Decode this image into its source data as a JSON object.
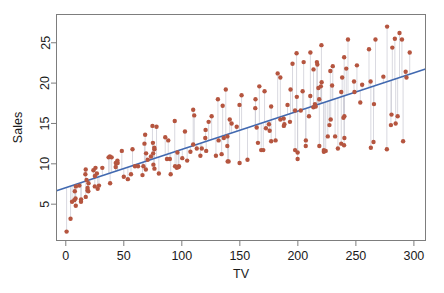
{
  "chart_data": {
    "type": "scatter",
    "title": "",
    "subtitle": "",
    "xlabel": "TV",
    "ylabel": "Sales",
    "xlim": [
      -8,
      310
    ],
    "ylim": [
      0.5,
      28.5
    ],
    "xticks": [
      0,
      50,
      100,
      150,
      200,
      250,
      300
    ],
    "xticklabels": [
      "0",
      "50",
      "100",
      "150",
      "200",
      "250",
      "300"
    ],
    "yticks": [
      5,
      10,
      15,
      20,
      25
    ],
    "yticklabels": [
      "5",
      "10",
      "15",
      "20",
      "25"
    ],
    "grid": false,
    "legend": null,
    "point_color": "#b5553f",
    "point_radius": 2.2,
    "line_color": "#4169b0",
    "line_width": 1.6,
    "residual_color": "#c8c8d2",
    "frame_color": "#7d7d7d",
    "background": "#ffffff",
    "annotations": [],
    "series": [
      {
        "name": "Sales vs TV",
        "x": [
          230.1,
          44.5,
          17.2,
          151.5,
          180.8,
          8.7,
          57.5,
          120.2,
          8.6,
          199.8,
          66.1,
          214.7,
          23.8,
          97.5,
          204.1,
          195.4,
          67.8,
          281.4,
          69.2,
          147.3,
          218.4,
          237.4,
          13.2,
          228.3,
          62.3,
          262.9,
          142.9,
          240.1,
          248.8,
          70.6,
          292.9,
          112.9,
          97.2,
          265.6,
          95.7,
          290.7,
          266.9,
          74.7,
          43.1,
          228.0,
          202.5,
          177.0,
          293.6,
          206.9,
          25.1,
          175.1,
          89.7,
          239.9,
          227.2,
          66.9,
          199.8,
          100.4,
          216.4,
          182.6,
          262.7,
          198.9,
          7.3,
          136.2,
          210.8,
          210.7,
          53.5,
          261.3,
          239.3,
          102.7,
          131.1,
          69.0,
          31.5,
          139.3,
          237.4,
          216.8,
          199.1,
          109.8,
          26.8,
          129.4,
          213.4,
          16.9,
          27.5,
          120.5,
          5.4,
          116.0,
          76.4,
          239.8,
          75.3,
          68.4,
          213.5,
          193.2,
          76.3,
          110.7,
          88.3,
          109.8,
          134.3,
          28.6,
          217.7,
          250.9,
          107.4,
          163.3,
          197.6,
          184.9,
          289.7,
          135.2,
          222.4,
          296.4,
          280.2,
          187.9,
          238.2,
          137.9,
          25.0,
          90.4,
          13.1,
          255.4,
          225.8,
          241.7,
          175.7,
          209.6,
          78.2,
          75.1,
          139.2,
          76.4,
          125.7,
          19.4,
          141.3,
          18.8,
          224.0,
          123.1,
          229.5,
          87.2,
          7.8,
          80.2,
          220.3,
          59.6,
          0.7,
          265.2,
          8.4,
          219.8,
          36.9,
          48.3,
          25.6,
          273.7,
          43.0,
          184.9,
          73.4,
          193.7,
          220.5,
          104.6,
          96.2,
          140.3,
          240.1,
          243.2,
          38.0,
          44.7,
          280.7,
          121.0,
          197.6,
          171.3,
          187.8,
          4.1,
          93.9,
          149.8,
          11.7,
          131.7,
          172.5,
          85.7,
          188.4,
          163.5,
          117.2,
          234.5,
          17.9,
          206.8,
          215.4,
          284.3,
          50.0,
          164.5,
          19.6,
          168.4,
          222.4,
          276.9,
          248.4,
          170.2,
          276.7,
          165.6,
          156.6,
          218.5,
          56.2,
          287.6,
          253.8,
          205.0,
          139.5,
          191.1,
          286.0,
          18.7,
          39.5,
          75.5,
          17.2,
          166.8,
          149.7,
          38.2,
          94.2,
          177.0,
          283.6,
          232.1
        ],
        "y": [
          22.1,
          10.4,
          9.3,
          18.5,
          12.9,
          7.2,
          11.8,
          13.2,
          4.8,
          10.6,
          8.6,
          17.4,
          9.2,
          9.7,
          19.0,
          22.4,
          12.5,
          24.4,
          11.3,
          14.6,
          18.0,
          12.5,
          5.6,
          15.5,
          9.7,
          12.0,
          15.0,
          15.9,
          18.9,
          10.5,
          21.4,
          11.9,
          9.6,
          17.4,
          9.5,
          12.8,
          25.4,
          14.7,
          10.1,
          21.5,
          16.6,
          17.1,
          20.7,
          12.9,
          8.5,
          14.9,
          10.6,
          23.2,
          14.8,
          9.7,
          11.4,
          10.7,
          22.6,
          21.2,
          20.2,
          23.7,
          5.5,
          13.2,
          23.8,
          18.4,
          8.1,
          24.2,
          15.7,
          14.0,
          18.0,
          9.3,
          9.5,
          13.4,
          18.9,
          22.3,
          18.3,
          12.4,
          8.8,
          11.0,
          17.0,
          8.7,
          6.9,
          14.2,
          5.3,
          11.0,
          11.8,
          12.3,
          11.3,
          13.6,
          21.7,
          15.2,
          12.0,
          16.0,
          12.9,
          16.7,
          11.2,
          7.3,
          19.4,
          22.2,
          11.5,
          16.9,
          11.7,
          15.5,
          25.4,
          17.2,
          11.7,
          23.8,
          14.8,
          14.7,
          20.7,
          19.2,
          7.2,
          8.7,
          5.3,
          19.8,
          13.4,
          21.8,
          14.1,
          15.9,
          14.6,
          12.6,
          12.2,
          9.4,
          15.9,
          6.6,
          15.5,
          7.0,
          11.6,
          15.2,
          19.7,
          10.6,
          6.6,
          8.8,
          24.7,
          9.7,
          1.6,
          12.7,
          5.7,
          19.6,
          10.8,
          11.6,
          9.5,
          20.8,
          9.6,
          20.7,
          10.9,
          19.2,
          20.1,
          10.4,
          11.4,
          10.3,
          13.2,
          25.4,
          10.9,
          10.1,
          16.1,
          11.6,
          16.6,
          19.0,
          15.6,
          3.2,
          15.3,
          10.1,
          7.3,
          12.9,
          14.4,
          13.3,
          14.9,
          18.0,
          11.9,
          11.9,
          8.0,
          12.2,
          17.1,
          15.0,
          8.4,
          14.5,
          7.6,
          11.7,
          11.5,
          27.0,
          20.2,
          11.7,
          11.8,
          12.6,
          10.5,
          12.2,
          8.7,
          26.2,
          17.6,
          22.6,
          10.3,
          17.3,
          15.9,
          6.7,
          10.8,
          9.9,
          5.9,
          19.6,
          17.3,
          7.6,
          9.7,
          12.8,
          25.5,
          13.4
        ]
      }
    ],
    "fit_line": {
      "type": "linear-least-squares",
      "intercept": 7.0326,
      "slope": 0.0475,
      "x_start": -8,
      "x_end": 310
    },
    "residual_segments": true
  }
}
